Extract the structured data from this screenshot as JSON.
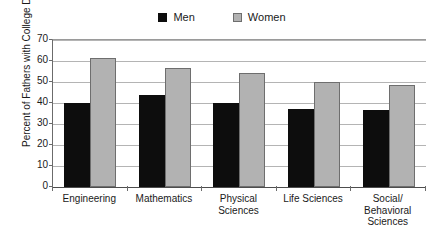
{
  "chart_data": {
    "type": "bar",
    "title": "",
    "subtitle": "",
    "xlabel": "",
    "ylabel": "Percent of Fathers with College Degrees",
    "ylim": [
      0,
      70
    ],
    "ytick_step": 10,
    "yticks": [
      70,
      60,
      50,
      40,
      30,
      20,
      10,
      0
    ],
    "grid": true,
    "legend_position": "top-center",
    "categories": [
      "Engineering",
      "Mathematics",
      "Physical Sciences",
      "Life Sciences",
      "Social/ Behavioral Sciences"
    ],
    "category_lines": [
      [
        "Engineering"
      ],
      [
        "Mathematics"
      ],
      [
        "Physical",
        "Sciences"
      ],
      [
        "Life Sciences"
      ],
      [
        "Social/",
        "Behavioral",
        "Sciences"
      ]
    ],
    "series": [
      {
        "name": "Men",
        "color": "#0d0d0d",
        "values": [
          40,
          44,
          40,
          37,
          36.5
        ]
      },
      {
        "name": "Women",
        "color": "#b2b2b2",
        "values": [
          61.5,
          56.5,
          54.5,
          50,
          48.5
        ]
      }
    ]
  },
  "legend": {
    "entries": [
      {
        "label": "Men",
        "swatch": "men-swatch"
      },
      {
        "label": "Women",
        "swatch": "women-swatch"
      }
    ]
  },
  "colors": {
    "men_fill": "#0d0d0d",
    "women_fill": "#b2b2b2",
    "women_border": "#6e6e6e",
    "gridline": "#b4b4b4",
    "axis": "#4d4d4d",
    "background": "#ffffff"
  }
}
